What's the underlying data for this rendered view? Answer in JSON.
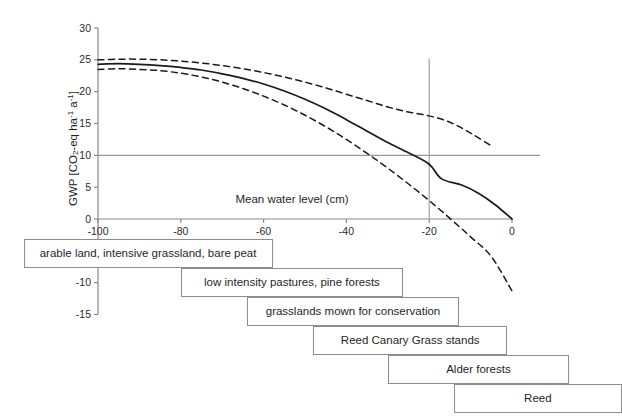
{
  "chart_data": {
    "type": "line",
    "title": "",
    "xlabel": "Mean water level (cm)",
    "ylabel": "GWP [CO2-eq ha-1 a-1]",
    "ylabel_parts": {
      "prefix": "GWP [CO",
      "sub1": "2",
      "mid": "-eq ha",
      "sup1": "-1",
      "mid2": " a",
      "sup2": "-1",
      "suffix": "]"
    },
    "xlim": [
      -100,
      0
    ],
    "ylim": [
      -15,
      30
    ],
    "xticks": [
      -100,
      -80,
      -60,
      -40,
      -20,
      0
    ],
    "xtick_labels": [
      "-100",
      "-80",
      "-60",
      "-40",
      "-20",
      "0"
    ],
    "yticks": [
      30,
      25,
      20,
      15,
      10,
      5,
      0,
      -10,
      -15
    ],
    "ytick_labels": [
      "30",
      "25",
      "20",
      "15",
      "10",
      "5",
      "0",
      "-10",
      "-15"
    ],
    "grid": false,
    "legend": "none",
    "reference_lines": [
      {
        "name": "gwp-10-reference",
        "orientation": "horizontal",
        "value": 10,
        "color": "#999999"
      },
      {
        "name": "water-level-20-reference",
        "orientation": "vertical",
        "value": -20,
        "color": "#999999"
      }
    ],
    "series": [
      {
        "name": "upper confidence band",
        "style": "dashed",
        "color": "#1a1a1a",
        "x": [
          -100,
          -95,
          -90,
          -85,
          -80,
          -75,
          -70,
          -65,
          -60,
          -55,
          -50,
          -45,
          -40,
          -35,
          -30,
          -25,
          -20,
          -15,
          -10,
          -5
        ],
        "values": [
          25.0,
          25.1,
          25.1,
          25.0,
          24.8,
          24.5,
          24.1,
          23.6,
          23.0,
          22.3,
          21.5,
          20.6,
          19.6,
          18.6,
          17.6,
          16.8,
          16.2,
          15.2,
          13.5,
          11.5
        ]
      },
      {
        "name": "mean GWP",
        "style": "solid",
        "color": "#1a1a1a",
        "x": [
          -100,
          -95,
          -90,
          -85,
          -80,
          -75,
          -70,
          -65,
          -60,
          -55,
          -50,
          -45,
          -40,
          -35,
          -30,
          -25,
          -20,
          -17,
          -12,
          -8,
          -4,
          0
        ],
        "values": [
          24.3,
          24.4,
          24.3,
          24.1,
          23.8,
          23.4,
          22.8,
          22.1,
          21.2,
          20.1,
          18.8,
          17.3,
          15.6,
          13.8,
          12.0,
          10.4,
          8.6,
          6.3,
          5.3,
          4.0,
          2.2,
          0.0
        ]
      },
      {
        "name": "lower confidence band",
        "style": "dashed",
        "color": "#1a1a1a",
        "x": [
          -100,
          -95,
          -90,
          -85,
          -80,
          -75,
          -70,
          -65,
          -60,
          -55,
          -50,
          -45,
          -40,
          -35,
          -30,
          -25,
          -20,
          -15,
          -10,
          -5,
          0
        ],
        "values": [
          23.5,
          23.6,
          23.5,
          23.3,
          22.9,
          22.3,
          21.5,
          20.5,
          19.3,
          17.9,
          16.3,
          14.5,
          12.5,
          10.3,
          8.0,
          5.5,
          2.9,
          0.1,
          -2.8,
          -5.9,
          -11.3
        ]
      }
    ],
    "category_boxes": [
      {
        "name": "arable-land-box",
        "label": "arable land, intensive grassland, bare peat",
        "x_start": -118.0,
        "x_end": -57.8
      },
      {
        "name": "low-intensity-pastures-box",
        "label": "low intensity pastures, pine forests",
        "x_start": -80.0,
        "x_end": -26.3
      },
      {
        "name": "grasslands-conservation-box",
        "label": "grasslands mown for conservation",
        "x_start": -64.0,
        "x_end": -12.8
      },
      {
        "name": "reed-canary-grass-box",
        "label": "Reed Canary Grass stands",
        "x_start": -48.0,
        "x_end": -1.2
      },
      {
        "name": "alder-forests-box",
        "label": "Alder forests",
        "x_start": -30.0,
        "x_end": 13.8
      },
      {
        "name": "reed-box",
        "label": "Reed",
        "x_start": -14.0,
        "x_end": 26.5
      }
    ]
  }
}
